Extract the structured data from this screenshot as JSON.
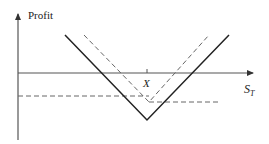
{
  "diagram": {
    "type": "payoff-diagram",
    "y_axis_label": "Profit",
    "x_axis_label_main": "S",
    "x_axis_label_sub": "T",
    "strike_label": "X",
    "colors": {
      "axis": "#555555",
      "solid_line": "#222222",
      "dashed_line": "#666666",
      "text": "#222222"
    },
    "lines": [
      {
        "name": "combined-payoff",
        "style": "solid",
        "points": [
          [
            65,
            35
          ],
          [
            147,
            120
          ],
          [
            229,
            35
          ]
        ]
      },
      {
        "name": "component-payoff",
        "style": "dashed",
        "points": [
          [
            84,
            35
          ],
          [
            149,
            102
          ],
          [
            209,
            35
          ]
        ]
      },
      {
        "name": "put-premium-level",
        "style": "dashed",
        "points": [
          [
            18,
            96
          ],
          [
            149,
            96
          ]
        ]
      },
      {
        "name": "call-premium-level",
        "style": "dashed",
        "points": [
          [
            149,
            102
          ],
          [
            220,
            102
          ]
        ]
      }
    ]
  }
}
